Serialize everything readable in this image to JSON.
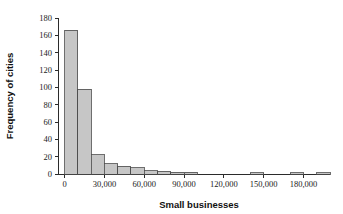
{
  "chart_data": {
    "type": "bar",
    "title": "",
    "subtitle": "",
    "xlabel": "Small businesses",
    "ylabel": "Frequency of cities",
    "xlim": [
      -5000,
      200000
    ],
    "ylim": [
      0,
      180
    ],
    "grid": false,
    "legend": null,
    "bin_width": 10000,
    "xticks": [
      0,
      30000,
      60000,
      90000,
      120000,
      150000,
      180000
    ],
    "xticklabels": [
      "0",
      "30,000",
      "60,000",
      "90,000",
      "120,000",
      "150,000",
      "180,000"
    ],
    "yticks": [
      0,
      20,
      40,
      60,
      80,
      100,
      120,
      140,
      160,
      180
    ],
    "yticklabels": [
      "0",
      "20",
      "40",
      "60",
      "80",
      "100",
      "120",
      "140",
      "160",
      "180"
    ],
    "bin_starts": [
      0,
      10000,
      20000,
      30000,
      40000,
      50000,
      60000,
      70000,
      80000,
      90000,
      140000,
      170000,
      190000
    ],
    "categories": [
      "0-10,000",
      "10,000-20,000",
      "20,000-30,000",
      "30,000-40,000",
      "40,000-50,000",
      "50,000-60,000",
      "60,000-70,000",
      "70,000-80,000",
      "80,000-90,000",
      "90,000-100,000",
      "140,000-150,000",
      "170,000-180,000",
      "190,000-200,000"
    ],
    "values": [
      166,
      98,
      22,
      12,
      9,
      7,
      4,
      3,
      2,
      2,
      1,
      1,
      1
    ],
    "bar_color": "#c6c6c6",
    "bar_edge_color": "#4a4a4a",
    "axis_color": "#2b2b2b"
  }
}
